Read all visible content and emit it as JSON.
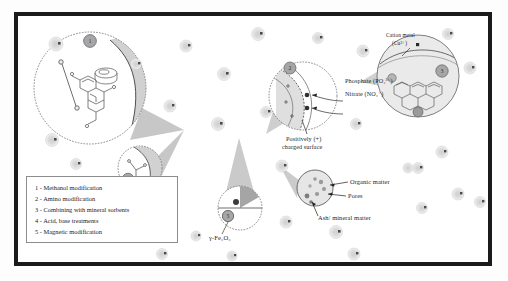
{
  "figure": {
    "type": "schematic-diagram",
    "border_color": "#1b1b1b",
    "background": "#ffffff"
  },
  "legend": {
    "border_color": "#8d8d8d",
    "items": [
      {
        "number": "1",
        "separator": " - ",
        "label": "Methanol modification"
      },
      {
        "number": "2",
        "separator": " - ",
        "label": "Amino modification"
      },
      {
        "number": "3",
        "separator": " - ",
        "label": "Combining with mineral sorbents"
      },
      {
        "number": "4",
        "separator": " - ",
        "label": "Acid, base treatments"
      },
      {
        "number": "5",
        "separator": " - ",
        "label": "Magnetic modification"
      }
    ]
  },
  "callouts": {
    "methanol": {
      "badge": "1",
      "name": "methanol-modification-magnifier"
    },
    "acid_base": {
      "badge": "4",
      "name": "acid-base-magnifier"
    },
    "amino": {
      "badge": "2",
      "name": "amino-modification-magnifier"
    },
    "mineral": {
      "badge": "3",
      "name": "mineral-sorbent-magnifier"
    },
    "magnetic": {
      "badge": "5",
      "name": "magnetic-modification-magnifier"
    }
  },
  "labels": {
    "phosphate": "Phosphate (PO₄³⁻)",
    "nitrate": "Nitrate (NO₃⁻)",
    "charged_surface_line1": "Positively (+)",
    "charged_surface_line2": "charged surface",
    "cation_metal_line1": "Cation metal",
    "cation_metal_line2": "(Cu²⁺)",
    "organic_matter": "Organic matter",
    "pores": "Pores",
    "ash_mineral": "Ash/ mineral matter",
    "maghemite": "γ-Fe₂O₃"
  },
  "colors": {
    "outline": "#5c5c5c",
    "cone_fill": "#bdbdbd",
    "particle_fill": "#d9d9d9",
    "particle_dot": "#4a4a4a",
    "badge_fill": "#a6a6a6",
    "wedge_fill": "#c9c9c9",
    "dark_dot": "#8f8f8f"
  }
}
